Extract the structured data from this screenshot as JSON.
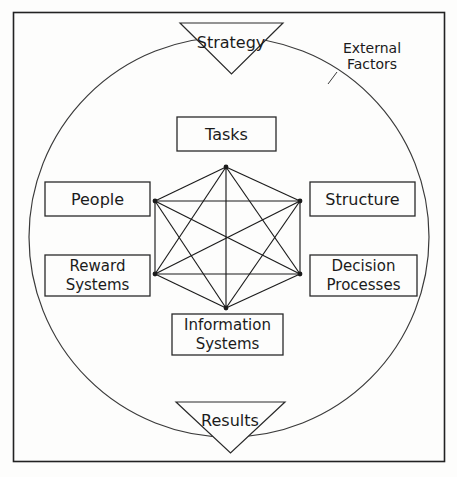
{
  "diagram": {
    "frame": {
      "stroke": "#222222"
    },
    "circle": {
      "label": "External Factors",
      "label_line1": "External",
      "label_line2": "Factors",
      "stroke": "#3a3a3a"
    },
    "input_triangle": {
      "label": "Strategy"
    },
    "output_triangle": {
      "label": "Results"
    },
    "nodes": [
      {
        "id": "tasks",
        "label": "Tasks",
        "line1": "Tasks",
        "line2": "",
        "position": "top"
      },
      {
        "id": "people",
        "label": "People",
        "line1": "People",
        "line2": "",
        "position": "upper-left"
      },
      {
        "id": "structure",
        "label": "Structure",
        "line1": "Structure",
        "line2": "",
        "position": "upper-right"
      },
      {
        "id": "reward",
        "label": "Reward Systems",
        "line1": "Reward",
        "line2": "Systems",
        "position": "lower-left"
      },
      {
        "id": "decision",
        "label": "Decision Processes",
        "line1": "Decision",
        "line2": "Processes",
        "position": "lower-right"
      },
      {
        "id": "information",
        "label": "Information Systems",
        "line1": "Information",
        "line2": "Systems",
        "position": "bottom"
      }
    ],
    "connections": [
      [
        "tasks",
        "people"
      ],
      [
        "tasks",
        "structure"
      ],
      [
        "tasks",
        "reward"
      ],
      [
        "tasks",
        "decision"
      ],
      [
        "tasks",
        "information"
      ],
      [
        "people",
        "structure"
      ],
      [
        "people",
        "reward"
      ],
      [
        "people",
        "decision"
      ],
      [
        "people",
        "information"
      ],
      [
        "structure",
        "reward"
      ],
      [
        "structure",
        "decision"
      ],
      [
        "structure",
        "information"
      ],
      [
        "reward",
        "decision"
      ],
      [
        "reward",
        "information"
      ],
      [
        "decision",
        "information"
      ]
    ],
    "colors": {
      "line": "#1b1b1b",
      "box_stroke": "#2a2a2a",
      "text": "#1b1b1b",
      "background": "#fdfdfc"
    }
  }
}
